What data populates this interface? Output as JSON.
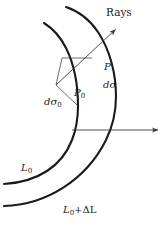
{
  "figure": {
    "name": "wavefront-ray-tube-diagram",
    "background_color": "#ffffff",
    "stroke_color": "#1a1a1a",
    "thin_stroke_color": "#4a4a4a"
  },
  "labels": {
    "rays": "Rays",
    "p": "P",
    "d_sigma": "dσ",
    "d_sigma_sub": "",
    "p0": "P",
    "p0_sub": "0",
    "d_sigma0": "dσ",
    "d_sigma0_sub": "0",
    "l0": "L",
    "l0_sub": "0",
    "l0_delta": "L",
    "l0_delta_sub": "0",
    "l0_delta_rest": "+ΔL"
  },
  "geometry": {
    "inner_arc_label": "L0",
    "outer_arc_label": "L0+ΔL",
    "horizontal_ray_start_x": 72,
    "horizontal_ray_y": 130,
    "horizontal_ray_end_x": 161,
    "diagonal_ray_start_x": 56,
    "diagonal_ray_start_y": 85,
    "diagonal_ray_end_x": 118,
    "diagonal_ray_end_y": 27
  }
}
